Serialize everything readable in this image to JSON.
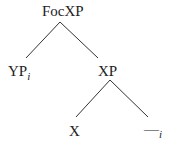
{
  "diagram": {
    "type": "syntax-tree",
    "nodes": {
      "root": {
        "label": "FocXP"
      },
      "left": {
        "label": "YP",
        "subscript": "i"
      },
      "right": {
        "label": "XP"
      },
      "head": {
        "label": "X"
      },
      "trace": {
        "label": "—",
        "subscript": "i"
      }
    },
    "edges": [
      [
        "FocXP",
        "YP_i"
      ],
      [
        "FocXP",
        "XP"
      ],
      [
        "XP",
        "X"
      ],
      [
        "XP",
        "—_i"
      ]
    ],
    "line_color": "#333333"
  }
}
